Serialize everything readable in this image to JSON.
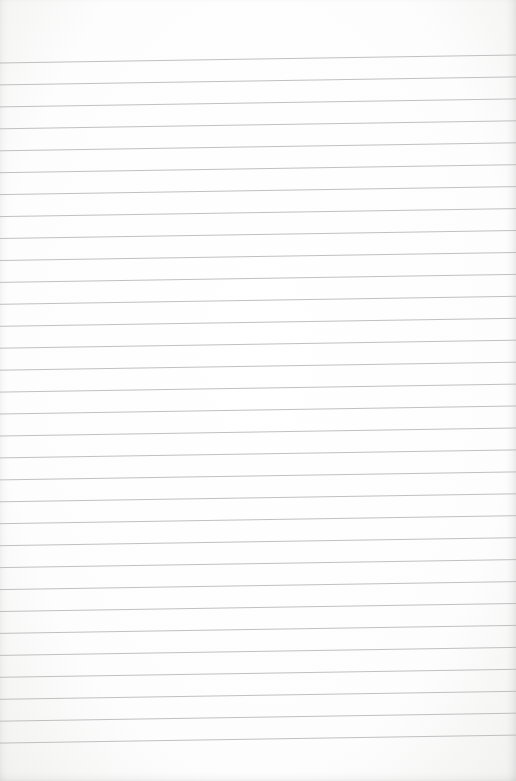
{
  "image": {
    "description": "Blank sheet of lined notebook paper",
    "width": 516,
    "height": 781,
    "paper_color": "#ffffff",
    "line_color": "#b9b9b9",
    "lines": {
      "count": 32,
      "first_left_y": 63,
      "first_right_y": 55,
      "spacing": 21.94
    }
  }
}
